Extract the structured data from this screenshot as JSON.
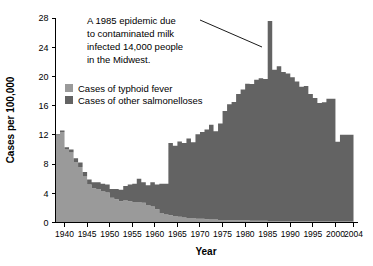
{
  "chart_data": {
    "type": "area",
    "title": "",
    "xlabel": "Year",
    "ylabel": "Cases per 100,000",
    "xlim": [
      1938,
      2004
    ],
    "ylim": [
      0,
      28
    ],
    "grid": false,
    "legend_position": "upper-left-inside",
    "ytick_labels": [
      "0",
      "4",
      "8",
      "12",
      "16",
      "20",
      "24",
      "28"
    ],
    "ytick_values": [
      0,
      4,
      8,
      12,
      16,
      20,
      24,
      28
    ],
    "xtick_labels": [
      "1940",
      "1945",
      "1950",
      "1955",
      "1960",
      "1965",
      "1970",
      "1975",
      "1980",
      "1985",
      "1990",
      "1995",
      "2000",
      "2004"
    ],
    "xtick_values": [
      1940,
      1945,
      1950,
      1955,
      1960,
      1965,
      1970,
      1975,
      1980,
      1985,
      1990,
      1995,
      2000,
      2004
    ],
    "x": [
      1938,
      1939,
      1940,
      1941,
      1942,
      1943,
      1944,
      1945,
      1946,
      1947,
      1948,
      1949,
      1950,
      1951,
      1952,
      1953,
      1954,
      1955,
      1956,
      1957,
      1958,
      1959,
      1960,
      1961,
      1962,
      1963,
      1964,
      1965,
      1966,
      1967,
      1968,
      1969,
      1970,
      1971,
      1972,
      1973,
      1974,
      1975,
      1976,
      1977,
      1978,
      1979,
      1980,
      1981,
      1982,
      1983,
      1984,
      1985,
      1986,
      1987,
      1988,
      1989,
      1990,
      1991,
      1992,
      1993,
      1994,
      1995,
      1996,
      1997,
      1998,
      1999,
      2000,
      2001,
      2002,
      2003
    ],
    "series": [
      {
        "name": "Cases of typhoid fever",
        "color": "#9a9a9a",
        "values": [
          11.9,
          12.4,
          10.0,
          9.6,
          8.3,
          7.6,
          6.3,
          5.2,
          4.7,
          4.6,
          4.3,
          4.1,
          3.4,
          3.2,
          2.9,
          3.0,
          2.9,
          2.8,
          2.8,
          2.7,
          2.4,
          2.2,
          1.8,
          1.3,
          1.1,
          1.0,
          0.9,
          0.8,
          0.7,
          0.6,
          0.6,
          0.5,
          0.5,
          0.45,
          0.4,
          0.4,
          0.35,
          0.35,
          0.3,
          0.3,
          0.3,
          0.3,
          0.3,
          0.25,
          0.25,
          0.25,
          0.25,
          0.2,
          0.2,
          0.2,
          0.2,
          0.2,
          0.2,
          0.2,
          0.2,
          0.2,
          0.2,
          0.15,
          0.15,
          0.15,
          0.15,
          0.15,
          0.15,
          0.15,
          0.15,
          0.15
        ]
      },
      {
        "name": "Cases of other salmonelloses",
        "color": "#636363",
        "values": [
          0.2,
          0.2,
          0.3,
          0.4,
          0.5,
          0.6,
          0.6,
          0.7,
          0.8,
          0.9,
          1.0,
          1.1,
          1.2,
          1.4,
          1.6,
          2.0,
          2.3,
          2.5,
          3.2,
          2.8,
          2.7,
          3.3,
          3.4,
          4.0,
          4.2,
          9.9,
          9.6,
          10.3,
          10.2,
          10.9,
          10.4,
          11.6,
          11.9,
          12.3,
          13.0,
          12.1,
          13.2,
          14.9,
          15.9,
          16.2,
          17.3,
          17.9,
          18.7,
          18.7,
          19.3,
          19.5,
          19.4,
          27.4,
          20.7,
          21.2,
          20.4,
          20.2,
          19.7,
          19.1,
          18.4,
          18.5,
          17.4,
          16.9,
          16.2,
          16.3,
          16.8,
          16.8,
          10.9,
          11.85,
          11.85,
          11.85
        ]
      }
    ],
    "annotations": [
      {
        "name": "epidemic-callout",
        "lines": [
          "A 1985 epidemic due",
          "to contaminated milk",
          "infected 14,000 people",
          "in the Midwest."
        ],
        "points_to_year": 1985,
        "points_to_value": 24.2
      }
    ]
  },
  "style": {
    "background": "#ffffff",
    "axis_color": "#000000",
    "typhoid_color": "#9a9a9a",
    "salmonelloses_color": "#636363"
  }
}
